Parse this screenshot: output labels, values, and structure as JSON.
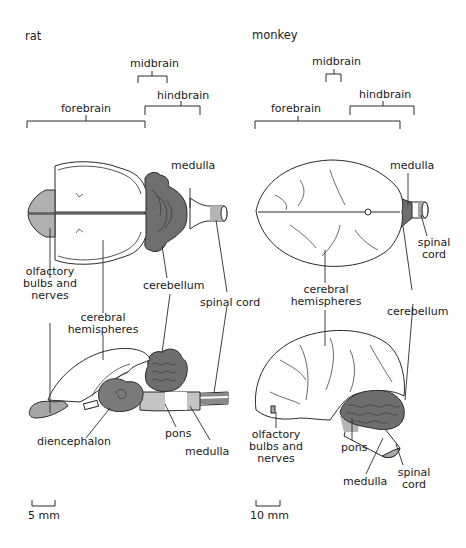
{
  "panels": {
    "rat": {
      "title": "rat",
      "regions": {
        "forebrain": "forebrain",
        "midbrain": "midbrain",
        "hindbrain": "hindbrain"
      },
      "labels": {
        "medulla_top": "medulla",
        "olfactory": [
          "olfactory",
          "bulbs and",
          "nerves"
        ],
        "cerebellum": "cerebellum",
        "spinal_cord": "spinal cord",
        "cerebral": [
          "cerebral",
          "hemispheres"
        ],
        "diencephalon": "diencephalon",
        "pons": "pons",
        "medulla_bottom": "medulla"
      },
      "scale": "5 mm"
    },
    "monkey": {
      "title": "monkey",
      "regions": {
        "forebrain": "forebrain",
        "midbrain": "midbrain",
        "hindbrain": "hindbrain"
      },
      "labels": {
        "medulla_top": "medulla",
        "spinal_cord_top": [
          "spinal",
          "cord"
        ],
        "cerebral": [
          "cerebral",
          "hemispheres"
        ],
        "cerebellum": "cerebellum",
        "olfactory": [
          "olfactory",
          "bulbs and",
          "nerves"
        ],
        "pons": "pons",
        "medulla_bottom": "medulla",
        "spinal_cord_bottom": [
          "spinal",
          "cord"
        ]
      },
      "scale": "10 mm"
    }
  },
  "colors": {
    "shade": "#a9a9a9",
    "dark": "#6f6f6f",
    "line": "#2a2a2a"
  }
}
